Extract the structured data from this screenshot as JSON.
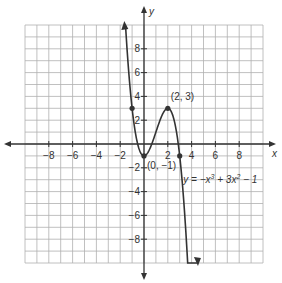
{
  "chart_data": {
    "type": "line",
    "title": "",
    "equation": "y = −x³ + 3x² − 1",
    "xlabel": "x",
    "ylabel": "y",
    "xlim": [
      -10,
      10
    ],
    "ylim": [
      -10,
      10
    ],
    "grid": true,
    "x_ticks": [
      -8,
      -6,
      -4,
      -2,
      2,
      4,
      6,
      8
    ],
    "y_ticks": [
      8,
      6,
      4,
      2,
      -2,
      -4,
      -6,
      -8
    ],
    "series": [
      {
        "name": "y = -x^3 + 3x^2 - 1",
        "function": "-x^3 + 3x^2 - 1",
        "x_range": [
          -1.55,
          4.45
        ]
      }
    ],
    "points": [
      {
        "x": -1,
        "y": 3,
        "label": ""
      },
      {
        "x": 0,
        "y": -1,
        "label": "(0, −1)"
      },
      {
        "x": 2,
        "y": 3,
        "label": "(2, 3)"
      },
      {
        "x": 3,
        "y": -1,
        "label": ""
      }
    ],
    "annotations": [
      {
        "text": "(2, 3)",
        "x": 2,
        "y": 3
      },
      {
        "text": "(0, −1)",
        "x": 0,
        "y": -1
      },
      {
        "text": "y = −x³ + 3x² − 1",
        "x": 3.2,
        "y": -3
      }
    ],
    "colors": {
      "curve": "#333333",
      "grid": "#b0b0b0",
      "axis": "#333333"
    }
  }
}
